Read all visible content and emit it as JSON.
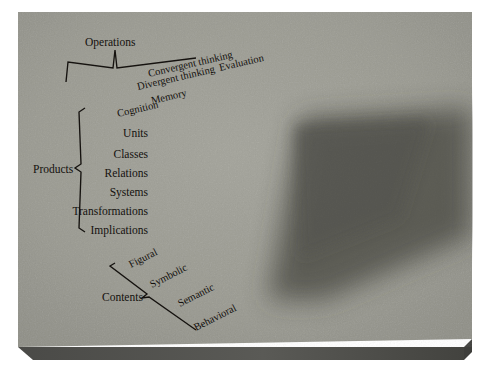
{
  "figure": {
    "type": "three-dimensional-cube-diagram",
    "background_color": "#9a9a92",
    "border_color": "#ffffff",
    "slab_edge_color": "#4d4d4a",
    "shadow_color": "#3b3b38",
    "label_color": "#141210"
  },
  "axes": {
    "operations": {
      "bracket_label": "Operations",
      "items": [
        "Evaluation",
        "Convergent thinking",
        "Divergent thinking",
        "Memory",
        "Cognition"
      ]
    },
    "products": {
      "bracket_label": "Products",
      "items": [
        "Units",
        "Classes",
        "Relations",
        "Systems",
        "Transformations",
        "Implications"
      ]
    },
    "contents": {
      "bracket_label": "Contents",
      "items": [
        "Figural",
        "Symbolic",
        "Semantic",
        "Behavioral"
      ]
    }
  },
  "cube": {
    "columns_left_face": 4,
    "columns_right_face": 5,
    "rows": 6,
    "top_face_grid": "4 x 5",
    "total_cells": 120,
    "top_shades": [
      [
        "#cfcdc2",
        "#b9b7ac",
        "#b1afa4",
        "#9e9c92",
        "#c6c4ba"
      ],
      [
        "#c4c2b7",
        "#a8a69c",
        "#cbc9bf",
        "#8e8c83",
        "#aaa89e"
      ],
      [
        "#d3d1c7",
        "#bab8ad",
        "#b5b3a8",
        "#a5a399",
        "#8c8a81"
      ],
      [
        "#c8c6bb",
        "#d7d5cb",
        "#a19f95",
        "#918f86",
        "#7e7c74"
      ]
    ],
    "left_shades": [
      [
        "#e3e1d7",
        "#d8d6cc",
        "#cfcdc3",
        "#c2c0b6"
      ],
      [
        "#b2b0a6",
        "#c5c3b9",
        "#dcdad0",
        "#cac8be"
      ],
      [
        "#cbc9bf",
        "#d2d0c6",
        "#bdbbb1",
        "#d6d4ca"
      ],
      [
        "#d9d7cd",
        "#c0beb4",
        "#ceccc2",
        "#c7c5bb"
      ],
      [
        "#c3c1b7",
        "#dddbd1",
        "#b6b4aa",
        "#d0cec4"
      ],
      [
        "#ccc9bf",
        "#e1dfd5",
        "#c8c6bc",
        "#dbd9cf"
      ]
    ],
    "right_shades": [
      [
        "#8a8880",
        "#7d7b73",
        "#6f6d66",
        "#86847c",
        "#5f5d57"
      ],
      [
        "#6e6c65",
        "#8b897f",
        "#7a7870",
        "#666459",
        "#55534e"
      ],
      [
        "#82807a",
        "#75736c",
        "#8e8c82",
        "#6a6861",
        "#5b5954"
      ],
      [
        "#7a7871",
        "#8c8a80",
        "#6d6b64",
        "#807e76",
        "#615f59"
      ],
      [
        "#888680",
        "#74726b",
        "#83817a",
        "#6b6962",
        "#57554f"
      ],
      [
        "#7f7d76",
        "#908e85",
        "#76746d",
        "#7c7a72",
        "#5e5c56"
      ]
    ]
  }
}
